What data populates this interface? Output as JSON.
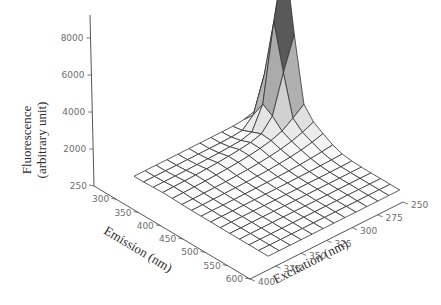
{
  "chart_data": {
    "type": "surface3d",
    "title": "",
    "zlabel_line1": "Fluorescence",
    "zlabel_line2": "(arbitrary unit)",
    "xlabel": "Emission (nm)",
    "ylabel": "Excitation (nm)",
    "z_ticks": [
      2000,
      4000,
      6000,
      8000
    ],
    "emission_ticks": [
      250,
      300,
      350,
      400,
      450,
      500,
      550,
      600
    ],
    "excitation_ticks": [
      250,
      275,
      300,
      325,
      350,
      375,
      400
    ],
    "zlim": [
      0,
      9000
    ],
    "emission_range": [
      250,
      600
    ],
    "excitation_range": [
      250,
      400
    ],
    "emission": [
      250,
      275,
      300,
      325,
      350,
      375,
      400,
      425,
      450,
      475,
      500,
      525,
      550,
      575,
      600
    ],
    "excitation": [
      250,
      262.5,
      275,
      287.5,
      300,
      312.5,
      325,
      337.5,
      350,
      362.5,
      375,
      387.5,
      400
    ],
    "peak": {
      "emission": 300,
      "excitation": 250,
      "fluorescence": 8600
    },
    "grid": "computed from peak model; low baseline ~0-400 elsewhere"
  },
  "axes_labels": {
    "z": [
      "2000",
      "4000",
      "6000",
      "8000"
    ],
    "emission": [
      "250",
      "300",
      "350",
      "400",
      "450",
      "500",
      "550",
      "600"
    ],
    "excitation": [
      "250",
      "275",
      "300",
      "325",
      "350",
      "375",
      "400"
    ]
  }
}
